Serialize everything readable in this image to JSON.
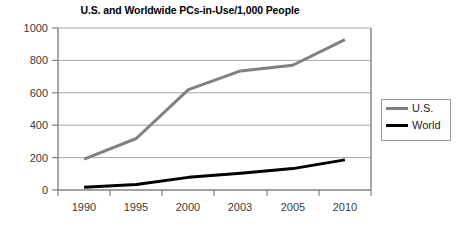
{
  "chart_data": {
    "type": "line",
    "title": "U.S. and Worldwide PCs-in-Use/1,000 People",
    "xlabel": "",
    "ylabel": "",
    "categories": [
      "1990",
      "1995",
      "2000",
      "2003",
      "2005",
      "2010"
    ],
    "ylim": [
      0,
      1000
    ],
    "yticks": [
      "0",
      "200",
      "400",
      "600",
      "800",
      "1000"
    ],
    "grid": true,
    "legend_position": "right",
    "series": [
      {
        "name": "U.S.",
        "color": "#808080",
        "values": [
          190,
          318,
          620,
          735,
          770,
          928
        ]
      },
      {
        "name": "World",
        "color": "#000000",
        "values": [
          17,
          34,
          78,
          104,
          132,
          186
        ]
      }
    ]
  },
  "legend": {
    "items": [
      {
        "label": "U.S."
      },
      {
        "label": "World"
      }
    ]
  },
  "colors": {
    "us_line": "#808080",
    "world_line": "#000000",
    "gridline": "#a9a9a9",
    "axis": "#808080",
    "text": "#3a3a3a",
    "legend_border": "#9a9a9a"
  }
}
